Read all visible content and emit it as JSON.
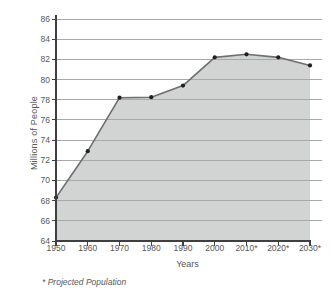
{
  "chart_data": {
    "type": "area",
    "title": "",
    "xlabel": "Years",
    "ylabel": "Millions of People",
    "categories": [
      "1950",
      "1960",
      "1970",
      "1980",
      "1990",
      "2000",
      "2010*",
      "2020*",
      "2030*"
    ],
    "values": [
      68.3,
      72.9,
      78.2,
      78.25,
      79.4,
      82.2,
      82.5,
      82.2,
      81.4
    ],
    "series": [
      {
        "name": "Population",
        "values": [
          68.3,
          72.9,
          78.2,
          78.25,
          79.4,
          82.2,
          82.5,
          82.2,
          81.4
        ]
      }
    ],
    "ylim": [
      64,
      86
    ],
    "ytick_labels": [
      "64",
      "66",
      "68",
      "70",
      "72",
      "74",
      "76",
      "78",
      "80",
      "82",
      "84",
      "86"
    ],
    "ytick_values": [
      64,
      66,
      68,
      70,
      72,
      74,
      76,
      78,
      80,
      82,
      84,
      86
    ],
    "xtick_labels": [
      "1950",
      "1960",
      "1970",
      "1980",
      "1990",
      "2000",
      "2010*",
      "2020*",
      "2030*"
    ],
    "grid": true,
    "legend": "none",
    "footnote": "* Projected Population",
    "colors": {
      "area_fill": "#d2d3d3",
      "line": "#6d6e70",
      "marker": "#231f20",
      "gridline": "#a7a9ac",
      "axis": "#3f3f41",
      "text": "#58585a",
      "background": "#ffffff"
    }
  }
}
